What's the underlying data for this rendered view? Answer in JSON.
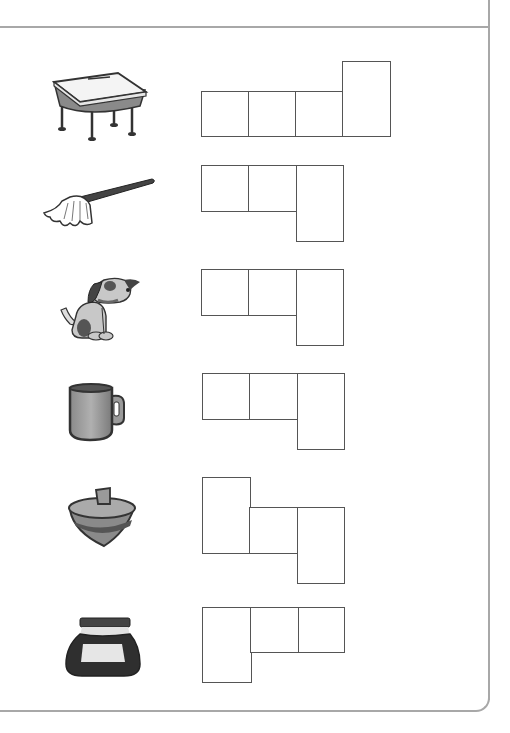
{
  "worksheet": {
    "type": "letter-box word puzzle",
    "line_color": "#555555",
    "border_color": "#a8a8a8",
    "rows": [
      {
        "picture": "desk-icon",
        "word_hint": "desk",
        "boxes": [
          {
            "x": 201,
            "y": 91,
            "w": 48,
            "h": 46
          },
          {
            "x": 249,
            "y": 91,
            "w": 47,
            "h": 46
          },
          {
            "x": 296,
            "y": 91,
            "w": 47,
            "h": 46
          },
          {
            "x": 343,
            "y": 61,
            "w": 48,
            "h": 76
          }
        ]
      },
      {
        "picture": "mop-icon",
        "word_hint": "mop",
        "boxes": [
          {
            "x": 201,
            "y": 165,
            "w": 48,
            "h": 47
          },
          {
            "x": 249,
            "y": 165,
            "w": 48,
            "h": 47
          },
          {
            "x": 297,
            "y": 165,
            "w": 47,
            "h": 76
          }
        ]
      },
      {
        "picture": "dog-icon",
        "word_hint": "dog",
        "boxes": [
          {
            "x": 201,
            "y": 269,
            "w": 48,
            "h": 47
          },
          {
            "x": 249,
            "y": 269,
            "w": 48,
            "h": 47
          },
          {
            "x": 297,
            "y": 269,
            "w": 47,
            "h": 76
          }
        ]
      },
      {
        "picture": "mug-icon",
        "word_hint": "mug",
        "boxes": [
          {
            "x": 202,
            "y": 373,
            "w": 48,
            "h": 47
          },
          {
            "x": 250,
            "y": 373,
            "w": 48,
            "h": 47
          },
          {
            "x": 298,
            "y": 373,
            "w": 47,
            "h": 76
          }
        ]
      },
      {
        "picture": "spinning-top-icon",
        "word_hint": "top",
        "boxes": [
          {
            "x": 202,
            "y": 477,
            "w": 48,
            "h": 77
          },
          {
            "x": 250,
            "y": 507,
            "w": 48,
            "h": 46
          },
          {
            "x": 298,
            "y": 507,
            "w": 47,
            "h": 76
          }
        ]
      },
      {
        "picture": "ink-pot-icon",
        "word_hint": "ink",
        "boxes": [
          {
            "x": 202,
            "y": 607,
            "w": 49,
            "h": 76
          },
          {
            "x": 251,
            "y": 607,
            "w": 48,
            "h": 46
          },
          {
            "x": 299,
            "y": 607,
            "w": 46,
            "h": 46
          }
        ]
      }
    ]
  }
}
